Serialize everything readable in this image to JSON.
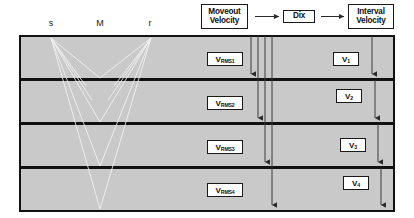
{
  "diagram": {
    "background_color": "#ffffff",
    "layer_fill_color": "#c9c9c9",
    "line_color": "#111111",
    "ray_color": "#f2f2f2"
  },
  "flow": {
    "moveout": {
      "line1": "Moveout",
      "line2": "Velocity"
    },
    "dix": {
      "line1": "Dix"
    },
    "interval": {
      "line1": "Interval",
      "line2": "Velocity"
    },
    "arrow1": "→",
    "arrow2": "→"
  },
  "surface": {
    "source_label": "s",
    "midpoint_label": "M",
    "receiver_label": "r"
  },
  "model": {
    "layers": [
      {
        "index": 1,
        "rms_symbol": "V",
        "rms_subscript": "RMS1",
        "interval_symbol": "V",
        "interval_subscript": "1"
      },
      {
        "index": 2,
        "rms_symbol": "V",
        "rms_subscript": "RMS2",
        "interval_symbol": "V",
        "interval_subscript": "2"
      },
      {
        "index": 3,
        "rms_symbol": "V",
        "rms_subscript": "RMS3",
        "interval_symbol": "V",
        "interval_subscript": "3"
      },
      {
        "index": 4,
        "rms_symbol": "V",
        "rms_subscript": "RMS4",
        "interval_symbol": "V",
        "interval_subscript": "4"
      }
    ]
  }
}
